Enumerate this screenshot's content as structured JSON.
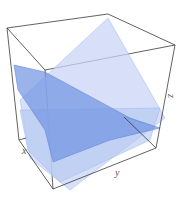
{
  "figure": {
    "type": "3d-plot",
    "axes": {
      "x_label": "x",
      "y_label": "y",
      "z_label": "z"
    },
    "colors": {
      "box_edge": "#3a3a3a",
      "plane_light": "#c9d6f5",
      "plane_mid": "#9fb7ef",
      "plane_dark": "#6f93e3",
      "background": "#ffffff"
    },
    "planes": [
      {
        "name": "plane-1",
        "orientation": "tilted, rising toward back-right"
      },
      {
        "name": "plane-2",
        "orientation": "tilted, descending toward right"
      },
      {
        "name": "plane-3",
        "orientation": "near-horizontal lower plane"
      }
    ]
  }
}
